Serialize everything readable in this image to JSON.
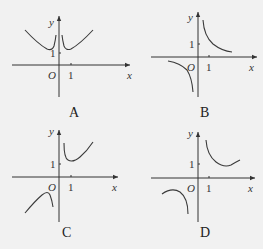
{
  "panels": [
    {
      "id": "A",
      "label": "A",
      "x_axis": "x",
      "y_axis": "y",
      "origin": "O",
      "x_tick": "1",
      "y_tick": "1"
    },
    {
      "id": "B",
      "label": "B",
      "x_axis": "x",
      "y_axis": "y",
      "origin": "O",
      "x_tick": "1",
      "y_tick": "1"
    },
    {
      "id": "C",
      "label": "C",
      "x_axis": "x",
      "y_axis": "y",
      "origin": "O",
      "x_tick": "1",
      "y_tick": "1"
    },
    {
      "id": "D",
      "label": "D",
      "x_axis": "x",
      "y_axis": "y",
      "origin": "O",
      "x_tick": "1",
      "y_tick": "1"
    }
  ],
  "colors": {
    "background": "#f1f1f1",
    "ink": "#333333"
  }
}
